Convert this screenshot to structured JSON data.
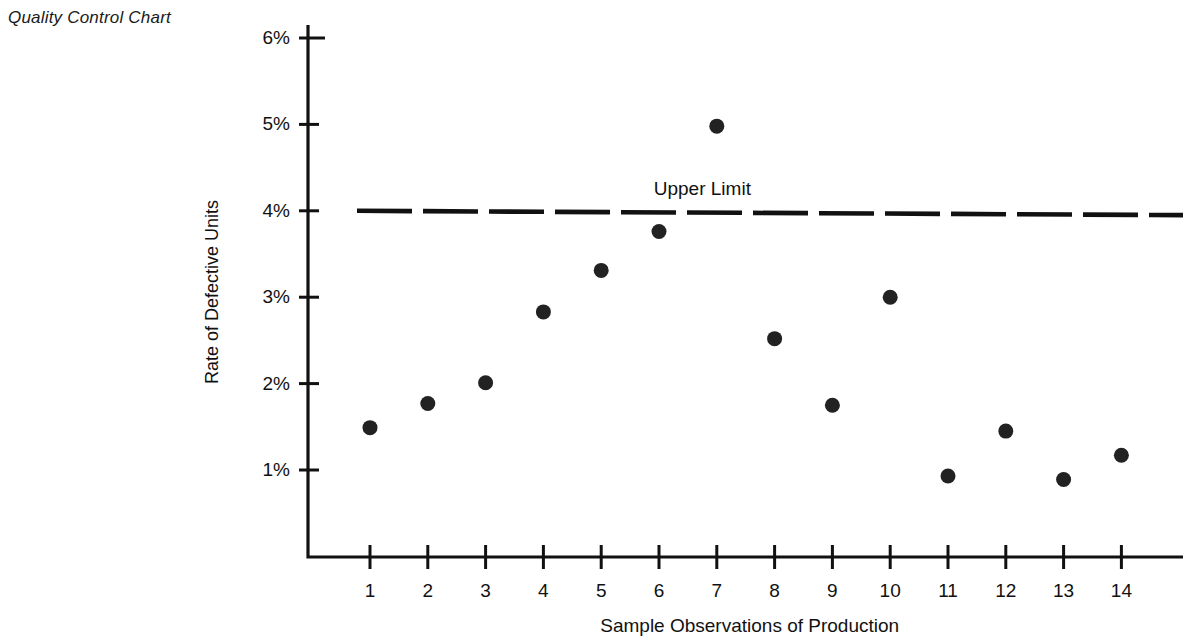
{
  "figure": {
    "caption": "Quality Control Chart"
  },
  "chart_data": {
    "type": "scatter",
    "title": "Quality Control Chart",
    "xlabel": "Sample Observations of Production",
    "ylabel": "Rate of Defective Units",
    "categories": [
      "1",
      "2",
      "3",
      "4",
      "5",
      "6",
      "7",
      "8",
      "9",
      "10",
      "11",
      "12",
      "13",
      "14"
    ],
    "x": [
      1,
      2,
      3,
      4,
      5,
      6,
      7,
      8,
      9,
      10,
      11,
      12,
      13,
      14
    ],
    "values": [
      1.49,
      1.77,
      2.01,
      2.83,
      3.31,
      3.76,
      4.98,
      2.52,
      1.75,
      3.0,
      0.93,
      1.45,
      0.89,
      1.17
    ],
    "value_unit": "%",
    "series": [
      {
        "name": "Rate of Defective Units",
        "values": [
          1.49,
          1.77,
          2.01,
          2.83,
          3.31,
          3.76,
          4.98,
          2.52,
          1.75,
          3.0,
          0.93,
          1.45,
          0.89,
          1.17
        ]
      }
    ],
    "ylim": [
      0,
      6
    ],
    "xlim": [
      0.45,
      14.6
    ],
    "yticks": [
      1,
      2,
      3,
      4,
      5,
      6
    ],
    "ytick_labels": [
      "1%",
      "2%",
      "3%",
      "4%",
      "5%",
      "6%"
    ],
    "xticks": [
      1,
      2,
      3,
      4,
      5,
      6,
      7,
      8,
      9,
      10,
      11,
      12,
      13,
      14
    ],
    "xtick_labels": [
      "1",
      "2",
      "3",
      "4",
      "5",
      "6",
      "7",
      "8",
      "9",
      "10",
      "11",
      "12",
      "13",
      "14"
    ],
    "grid": false,
    "legend": false,
    "annotations": [
      {
        "name": "upper-limit",
        "label": "Upper Limit",
        "type": "horizontal-dashed-line",
        "value_left": 4.0,
        "value_right": 3.95,
        "label_x": 6.75,
        "label_y": 4.15
      }
    ],
    "marker": {
      "shape": "circle",
      "color": "#222222",
      "size_px": 15
    },
    "line_color": "#111111",
    "axis_color": "#111111",
    "background": "#ffffff"
  }
}
